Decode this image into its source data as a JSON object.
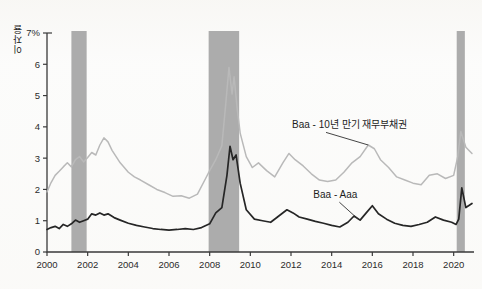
{
  "chart_data": {
    "type": "line",
    "title": "",
    "xlabel": "",
    "ylabel": "이자율",
    "ylabel_unit_tick": "7%",
    "xlim": [
      2000,
      2021
    ],
    "ylim": [
      0,
      7
    ],
    "grid": false,
    "legend_position": "inline-annotations",
    "y_ticks": [
      "0",
      "1",
      "2",
      "3",
      "4",
      "5",
      "6",
      "7%"
    ],
    "y_tick_values": [
      0,
      1,
      2,
      3,
      4,
      5,
      6,
      7
    ],
    "x_ticks": [
      "2000",
      "2002",
      "2004",
      "2006",
      "2008",
      "2010",
      "2012",
      "2014",
      "2016",
      "2018",
      "2020"
    ],
    "x_tick_values": [
      2000,
      2002,
      2004,
      2006,
      2008,
      2010,
      2012,
      2014,
      2016,
      2018,
      2020
    ],
    "annotations": [
      {
        "text": "Baa - 10년 만기 재무부채권",
        "series": "Baa - 10년 만기 재무부채권",
        "x_text": 2012.05,
        "y_text": 3.95,
        "x_point": 2015.8,
        "y_point": 3.42
      },
      {
        "text": "Baa - Aaa",
        "series": "Baa - Aaa",
        "x_text": 2013.1,
        "y_text": 1.72,
        "x_point": 2015.35,
        "y_point": 1.02
      }
    ],
    "shaded_regions": [
      {
        "name": "recession-2001",
        "x0": 2001.2,
        "x1": 2001.95,
        "color": "#a8a8a8"
      },
      {
        "name": "recession-2008",
        "x0": 2007.95,
        "x1": 2009.45,
        "color": "#a8a8a8"
      },
      {
        "name": "recession-2020",
        "x0": 2020.15,
        "x1": 2020.55,
        "color": "#a8a8a8"
      }
    ],
    "series": [
      {
        "name": "Baa - 10년 만기 재무부채권",
        "color": "#b9b9b9",
        "x": [
          2000.0,
          2000.2,
          2000.4,
          2000.6,
          2000.8,
          2001.0,
          2001.2,
          2001.4,
          2001.6,
          2001.8,
          2002.0,
          2002.2,
          2002.4,
          2002.6,
          2002.8,
          2003.0,
          2003.2,
          2003.4,
          2003.6,
          2003.8,
          2004.0,
          2004.3,
          2004.6,
          2005.0,
          2005.4,
          2005.8,
          2006.2,
          2006.6,
          2007.0,
          2007.4,
          2007.8,
          2008.0,
          2008.3,
          2008.6,
          2008.8,
          2008.95,
          2009.1,
          2009.2,
          2009.35,
          2009.5,
          2009.8,
          2010.1,
          2010.4,
          2010.8,
          2011.2,
          2011.6,
          2011.9,
          2012.2,
          2012.6,
          2013.0,
          2013.4,
          2013.8,
          2014.2,
          2014.6,
          2015.0,
          2015.4,
          2015.8,
          2016.1,
          2016.4,
          2016.8,
          2017.2,
          2017.6,
          2018.0,
          2018.4,
          2018.8,
          2019.2,
          2019.6,
          2020.0,
          2020.2,
          2020.35,
          2020.6,
          2020.9
        ],
        "y": [
          1.92,
          2.22,
          2.45,
          2.58,
          2.72,
          2.85,
          2.72,
          2.95,
          3.05,
          2.88,
          3.02,
          3.18,
          3.1,
          3.42,
          3.65,
          3.52,
          3.25,
          3.05,
          2.85,
          2.7,
          2.55,
          2.4,
          2.3,
          2.15,
          2.0,
          1.9,
          1.78,
          1.8,
          1.72,
          1.85,
          2.35,
          2.6,
          2.95,
          3.4,
          4.8,
          5.9,
          5.05,
          5.6,
          4.6,
          3.8,
          3.05,
          2.7,
          2.85,
          2.6,
          2.4,
          2.85,
          3.15,
          2.95,
          2.75,
          2.5,
          2.3,
          2.25,
          2.3,
          2.55,
          2.85,
          3.05,
          3.42,
          3.3,
          2.95,
          2.7,
          2.4,
          2.3,
          2.2,
          2.15,
          2.45,
          2.5,
          2.35,
          2.45,
          3.05,
          3.85,
          3.35,
          3.15
        ]
      },
      {
        "name": "Baa - Aaa",
        "color": "#262626",
        "x": [
          2000.0,
          2000.2,
          2000.4,
          2000.6,
          2000.8,
          2001.0,
          2001.2,
          2001.4,
          2001.6,
          2001.8,
          2002.0,
          2002.2,
          2002.4,
          2002.6,
          2002.8,
          2003.0,
          2003.3,
          2003.6,
          2004.0,
          2004.4,
          2004.8,
          2005.2,
          2005.6,
          2006.0,
          2006.4,
          2006.8,
          2007.2,
          2007.6,
          2008.0,
          2008.3,
          2008.6,
          2008.85,
          2009.0,
          2009.15,
          2009.3,
          2009.5,
          2009.8,
          2010.2,
          2010.6,
          2011.0,
          2011.4,
          2011.8,
          2012.1,
          2012.4,
          2012.8,
          2013.2,
          2013.6,
          2014.0,
          2014.4,
          2014.8,
          2015.1,
          2015.4,
          2015.7,
          2016.0,
          2016.3,
          2016.7,
          2017.1,
          2017.5,
          2017.9,
          2018.3,
          2018.7,
          2019.1,
          2019.5,
          2019.9,
          2020.12,
          2020.25,
          2020.4,
          2020.6,
          2020.9
        ],
        "y": [
          0.72,
          0.78,
          0.82,
          0.75,
          0.88,
          0.82,
          0.9,
          1.02,
          0.95,
          1.0,
          1.05,
          1.22,
          1.18,
          1.25,
          1.18,
          1.22,
          1.1,
          1.02,
          0.92,
          0.85,
          0.8,
          0.75,
          0.72,
          0.7,
          0.72,
          0.75,
          0.72,
          0.78,
          0.9,
          1.25,
          1.42,
          2.45,
          3.38,
          2.95,
          3.1,
          2.2,
          1.35,
          1.05,
          1.0,
          0.95,
          1.15,
          1.35,
          1.25,
          1.12,
          1.05,
          0.98,
          0.92,
          0.85,
          0.8,
          0.95,
          1.15,
          1.02,
          1.25,
          1.48,
          1.22,
          1.05,
          0.92,
          0.85,
          0.82,
          0.88,
          0.95,
          1.12,
          1.02,
          0.95,
          0.88,
          1.05,
          2.05,
          1.42,
          1.55
        ]
      }
    ]
  }
}
